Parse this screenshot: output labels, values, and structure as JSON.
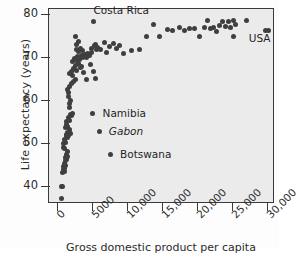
{
  "chart_data": {
    "type": "scatter",
    "title": "",
    "xlabel": "Gross domestic product per capita",
    "ylabel": "Life expectancy (years)",
    "xlim": [
      -1300,
      31000
    ],
    "ylim": [
      36,
      81.5
    ],
    "grid": false,
    "legend": "none",
    "xticks": [
      0,
      5000,
      10000,
      15000,
      20000,
      25000,
      30000
    ],
    "xtick_labels": [
      "0",
      "5000",
      "10,000",
      "15,000",
      "20,000",
      "25,000",
      "30,000"
    ],
    "yticks": [
      40,
      50,
      60,
      70,
      80
    ],
    "ytick_labels": [
      "40",
      "50",
      "60",
      "70",
      "80"
    ],
    "marker_color": "#3f3f3f",
    "plot_background": "#ebebeb",
    "annotations": [
      {
        "text": "Costa Rica",
        "x": 5200,
        "y": 80.8,
        "style": "normal",
        "marker": {
          "x": 5200,
          "y": 78.3
        }
      },
      {
        "text": "USA",
        "x": 27400,
        "y": 74.2,
        "style": "normal",
        "marker": null
      },
      {
        "text": "Namibia",
        "x": 6500,
        "y": 56.8,
        "style": "normal",
        "marker": {
          "x": 5100,
          "y": 56.8
        }
      },
      {
        "text": "Gabon",
        "x": 7400,
        "y": 52.6,
        "style": "italic",
        "marker": {
          "x": 6100,
          "y": 52.6
        }
      },
      {
        "text": "Botswana",
        "x": 9000,
        "y": 47.3,
        "style": "normal",
        "marker": {
          "x": 7700,
          "y": 47.3
        }
      }
    ],
    "points": [
      {
        "x": 430,
        "y": 37.2
      },
      {
        "x": 470,
        "y": 40.1
      },
      {
        "x": 640,
        "y": 40.2
      },
      {
        "x": 700,
        "y": 43.3
      },
      {
        "x": 760,
        "y": 44.0
      },
      {
        "x": 820,
        "y": 44.8
      },
      {
        "x": 880,
        "y": 43.6
      },
      {
        "x": 930,
        "y": 45.4
      },
      {
        "x": 980,
        "y": 44.2
      },
      {
        "x": 1030,
        "y": 46.1
      },
      {
        "x": 1080,
        "y": 45.0
      },
      {
        "x": 1120,
        "y": 46.8
      },
      {
        "x": 1180,
        "y": 47.6
      },
      {
        "x": 1230,
        "y": 46.4
      },
      {
        "x": 1290,
        "y": 48.3
      },
      {
        "x": 1340,
        "y": 47.1
      },
      {
        "x": 760,
        "y": 49.2
      },
      {
        "x": 830,
        "y": 50.1
      },
      {
        "x": 900,
        "y": 49.0
      },
      {
        "x": 980,
        "y": 51.0
      },
      {
        "x": 1050,
        "y": 50.3
      },
      {
        "x": 1140,
        "y": 51.8
      },
      {
        "x": 1220,
        "y": 52.3
      },
      {
        "x": 1310,
        "y": 51.5
      },
      {
        "x": 1400,
        "y": 52.6
      },
      {
        "x": 1480,
        "y": 52.0
      },
      {
        "x": 1560,
        "y": 52.7
      },
      {
        "x": 1630,
        "y": 53.4
      },
      {
        "x": 1710,
        "y": 52.5
      },
      {
        "x": 1020,
        "y": 53.9
      },
      {
        "x": 1130,
        "y": 54.5
      },
      {
        "x": 1260,
        "y": 55.3
      },
      {
        "x": 1380,
        "y": 54.2
      },
      {
        "x": 1490,
        "y": 56.2
      },
      {
        "x": 1610,
        "y": 55.4
      },
      {
        "x": 1720,
        "y": 57.0
      },
      {
        "x": 1900,
        "y": 56.6
      },
      {
        "x": 2080,
        "y": 57.2
      },
      {
        "x": 1560,
        "y": 58.5
      },
      {
        "x": 1640,
        "y": 59.4
      },
      {
        "x": 1790,
        "y": 60.1
      },
      {
        "x": 1430,
        "y": 61.0
      },
      {
        "x": 1530,
        "y": 62.0
      },
      {
        "x": 1350,
        "y": 62.8
      },
      {
        "x": 1620,
        "y": 63.5
      },
      {
        "x": 1900,
        "y": 64.1
      },
      {
        "x": 2180,
        "y": 64.7
      },
      {
        "x": 2460,
        "y": 65.0
      },
      {
        "x": 1700,
        "y": 66.4
      },
      {
        "x": 1880,
        "y": 67.0
      },
      {
        "x": 2060,
        "y": 66.0
      },
      {
        "x": 2260,
        "y": 67.6
      },
      {
        "x": 2480,
        "y": 68.3
      },
      {
        "x": 2700,
        "y": 67.2
      },
      {
        "x": 2920,
        "y": 68.9
      },
      {
        "x": 3150,
        "y": 67.8
      },
      {
        "x": 2100,
        "y": 69.3
      },
      {
        "x": 2340,
        "y": 70.0
      },
      {
        "x": 2580,
        "y": 69.5
      },
      {
        "x": 2820,
        "y": 70.4
      },
      {
        "x": 3060,
        "y": 69.8
      },
      {
        "x": 3290,
        "y": 70.7
      },
      {
        "x": 3520,
        "y": 70.1
      },
      {
        "x": 3760,
        "y": 71.0
      },
      {
        "x": 4000,
        "y": 70.3
      },
      {
        "x": 4240,
        "y": 71.2
      },
      {
        "x": 4480,
        "y": 70.6
      },
      {
        "x": 4720,
        "y": 71.4
      },
      {
        "x": 2700,
        "y": 72.1
      },
      {
        "x": 2950,
        "y": 71.6
      },
      {
        "x": 3200,
        "y": 72.4
      },
      {
        "x": 3450,
        "y": 71.9
      },
      {
        "x": 2620,
        "y": 73.2
      },
      {
        "x": 2880,
        "y": 74.0
      },
      {
        "x": 2420,
        "y": 75.2
      },
      {
        "x": 3400,
        "y": 68.0
      },
      {
        "x": 3700,
        "y": 66.6
      },
      {
        "x": 4100,
        "y": 65.1
      },
      {
        "x": 4700,
        "y": 68.6
      },
      {
        "x": 5100,
        "y": 67.0
      },
      {
        "x": 5300,
        "y": 65.2
      },
      {
        "x": 4800,
        "y": 72.2
      },
      {
        "x": 5150,
        "y": 72.9
      },
      {
        "x": 5400,
        "y": 73.3
      },
      {
        "x": 5450,
        "y": 72.0
      },
      {
        "x": 5700,
        "y": 72.6
      },
      {
        "x": 6100,
        "y": 72.1
      },
      {
        "x": 6600,
        "y": 73.6
      },
      {
        "x": 6900,
        "y": 71.4
      },
      {
        "x": 7400,
        "y": 72.8
      },
      {
        "x": 7900,
        "y": 73.5
      },
      {
        "x": 8300,
        "y": 72.2
      },
      {
        "x": 8800,
        "y": 73.0
      },
      {
        "x": 9400,
        "y": 71.2
      },
      {
        "x": 10500,
        "y": 71.9
      },
      {
        "x": 11700,
        "y": 72.0
      },
      {
        "x": 12600,
        "y": 75.1
      },
      {
        "x": 13600,
        "y": 77.9
      },
      {
        "x": 14500,
        "y": 75.0
      },
      {
        "x": 15600,
        "y": 76.8
      },
      {
        "x": 16400,
        "y": 76.6
      },
      {
        "x": 17300,
        "y": 77.2
      },
      {
        "x": 18100,
        "y": 76.4
      },
      {
        "x": 18800,
        "y": 77.0
      },
      {
        "x": 19500,
        "y": 76.9
      },
      {
        "x": 20200,
        "y": 75.2
      },
      {
        "x": 20900,
        "y": 77.3
      },
      {
        "x": 21300,
        "y": 78.8
      },
      {
        "x": 21800,
        "y": 76.9
      },
      {
        "x": 22200,
        "y": 77.1
      },
      {
        "x": 22600,
        "y": 76.3
      },
      {
        "x": 23100,
        "y": 77.6
      },
      {
        "x": 23500,
        "y": 78.7
      },
      {
        "x": 23900,
        "y": 77.4
      },
      {
        "x": 24300,
        "y": 78.5
      },
      {
        "x": 24700,
        "y": 77.1
      },
      {
        "x": 25000,
        "y": 78.8
      },
      {
        "x": 25300,
        "y": 78.0
      },
      {
        "x": 25100,
        "y": 75.1
      },
      {
        "x": 26900,
        "y": 78.9
      },
      {
        "x": 29700,
        "y": 76.4
      },
      {
        "x": 30100,
        "y": 76.4
      }
    ]
  }
}
